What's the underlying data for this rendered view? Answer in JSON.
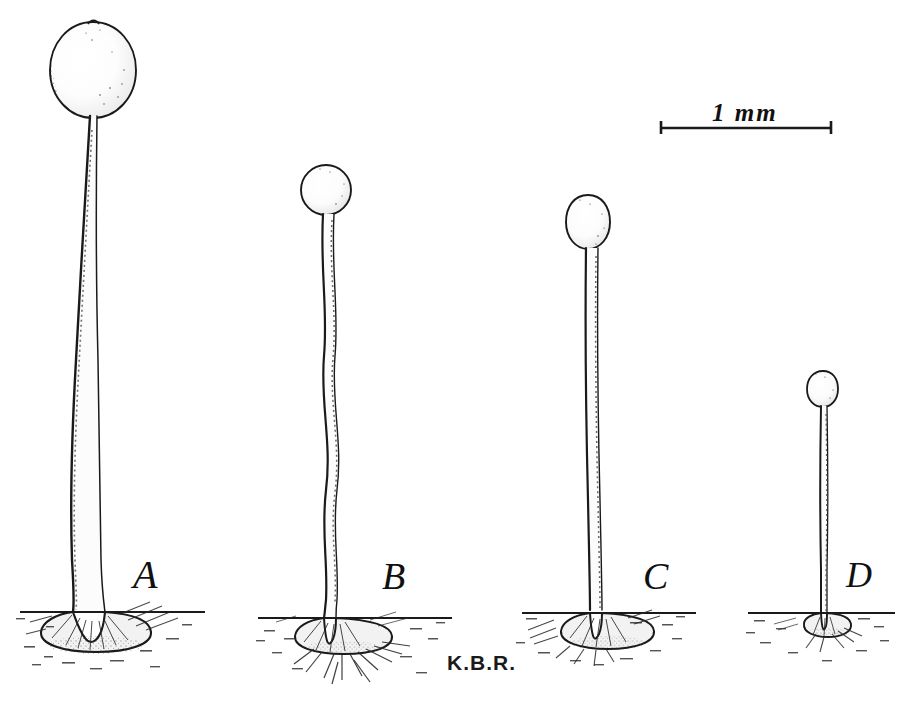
{
  "plate": {
    "kind": "scientific-illustration",
    "medium": "pen-and-ink stipple drawing",
    "subject": "four stalked fungal sporangia / fruiting bodies on substrate",
    "background_color": "#ffffff",
    "ink_color": "#1a1a1a",
    "signature": "K.B.R."
  },
  "scale_bar": {
    "label": "1 mm",
    "x": 660,
    "y": 122,
    "length_px": 172,
    "tick_height_px": 13
  },
  "specimens": [
    {
      "id": "A",
      "label": "A",
      "label_x": 133,
      "label_y": 555,
      "cap_cx": 93,
      "cap_cy": 70,
      "cap_rx": 43,
      "cap_ry": 48,
      "cap_shape": "broad teardrop-ovoid, apex tapered",
      "stalk_top_y": 118,
      "stalk_base_y": 612,
      "stalk_top_w": 6,
      "stalk_base_w": 17,
      "stalk_form": "long, gently sigmoid, thickening downward",
      "ground_y": 612,
      "ground_x1": 20,
      "ground_x2": 205,
      "disc_cx": 96,
      "disc_cy": 632,
      "disc_rx": 56,
      "disc_ry": 17,
      "relative_height": "tallest"
    },
    {
      "id": "B",
      "label": "B",
      "label_x": 382,
      "label_y": 557,
      "cap_cx": 326,
      "cap_cy": 190,
      "cap_rx": 24,
      "cap_ry": 25,
      "cap_shape": "small globose",
      "stalk_top_y": 215,
      "stalk_base_y": 618,
      "stalk_top_w": 4,
      "stalk_base_w": 12,
      "stalk_form": "distinctly wavy / sinuous",
      "ground_y": 618,
      "ground_x1": 258,
      "ground_x2": 452,
      "disc_cx": 332,
      "disc_cy": 637,
      "disc_rx": 44,
      "disc_ry": 14,
      "relative_height": "second tallest"
    },
    {
      "id": "C",
      "label": "C",
      "label_x": 643,
      "label_y": 557,
      "cap_cx": 588,
      "cap_cy": 222,
      "cap_rx": 22,
      "cap_ry": 27,
      "cap_shape": "ovoid, taller than wide",
      "stalk_top_y": 249,
      "stalk_base_y": 613,
      "stalk_top_w": 4,
      "stalk_base_w": 12,
      "stalk_form": "nearly straight, slight basal curve",
      "ground_y": 613,
      "ground_x1": 528,
      "ground_x2": 700,
      "disc_cx": 594,
      "disc_cy": 631,
      "disc_rx": 42,
      "disc_ry": 14,
      "relative_height": "third tallest"
    },
    {
      "id": "D",
      "label": "D",
      "label_x": 846,
      "label_y": 557,
      "cap_cx": 823,
      "cap_cy": 389,
      "cap_rx": 15,
      "cap_ry": 18,
      "cap_shape": "minute ovoid",
      "stalk_top_y": 407,
      "stalk_base_y": 613,
      "stalk_top_w": 3,
      "stalk_base_w": 6,
      "stalk_form": "short, slender, straight",
      "ground_y": 613,
      "ground_x1": 752,
      "ground_x2": 898,
      "disc_cx": 820,
      "disc_cy": 626,
      "disc_rx": 22,
      "disc_ry": 9,
      "relative_height": "smallest"
    }
  ],
  "signature_pos": {
    "x": 447,
    "y": 652
  }
}
